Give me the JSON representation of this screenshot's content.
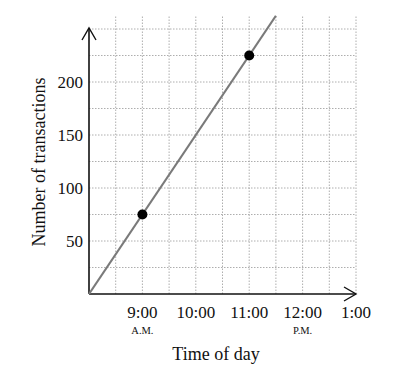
{
  "chart_data": {
    "type": "line",
    "title": "",
    "xlabel": "Time of day",
    "ylabel": "Number of transactions",
    "x_tick_labels": [
      {
        "label": "9:00",
        "sub": "A.M."
      },
      {
        "label": "10:00",
        "sub": ""
      },
      {
        "label": "11:00",
        "sub": ""
      },
      {
        "label": "12:00",
        "sub": "P.M."
      },
      {
        "label": "1:00",
        "sub": ""
      }
    ],
    "y_tick_labels": [
      "50",
      "100",
      "150",
      "200"
    ],
    "x_range_hours": [
      8,
      13
    ],
    "ylim": [
      0,
      250
    ],
    "grid": true,
    "series": [
      {
        "name": "transactions",
        "line": {
          "x": [
            "8:00 A.M.",
            "11:30 A.M."
          ],
          "y": [
            0,
            262.5
          ]
        },
        "points": [
          {
            "x": "9:00 A.M.",
            "y": 75
          },
          {
            "x": "11:00 A.M.",
            "y": 225
          }
        ]
      }
    ]
  },
  "colors": {
    "line": "#7a7a7a",
    "points": "#000000",
    "grid": "#999999",
    "axis": "#111111"
  }
}
